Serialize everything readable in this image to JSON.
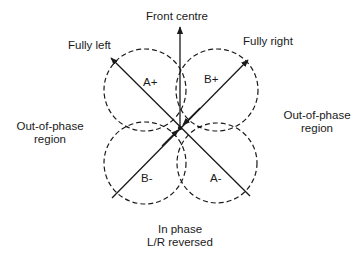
{
  "diagram": {
    "type": "polar-lobe-diagram",
    "axes": {
      "front_centre": "Front centre",
      "fully_left": "Fully left",
      "fully_right": "Fully right"
    },
    "regions": {
      "left": {
        "line1": "Out-of-phase",
        "line2": "region"
      },
      "right": {
        "line1": "Out-of-phase",
        "line2": "region"
      },
      "bottom": {
        "line1": "In phase",
        "line2": "L/R reversed"
      }
    },
    "lobes": [
      {
        "label": "A+",
        "position": "upper-left"
      },
      {
        "label": "B+",
        "position": "upper-right"
      },
      {
        "label": "B-",
        "position": "lower-left"
      },
      {
        "label": "A-",
        "position": "lower-right"
      }
    ],
    "colors": {
      "line": "#1a1a1a",
      "background": "#ffffff"
    }
  }
}
